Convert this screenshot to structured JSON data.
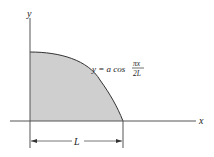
{
  "diagram": {
    "axes": {
      "x_label": "x",
      "y_label": "y"
    },
    "curve": {
      "equation_lhs": "y = a cos",
      "fraction_numerator": "πx",
      "fraction_denominator": "2L"
    },
    "dimension": {
      "label": "L"
    },
    "colors": {
      "fill": "#cfcfcf",
      "stroke": "#333333",
      "background": "#ffffff"
    }
  }
}
